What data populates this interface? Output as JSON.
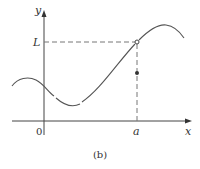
{
  "figure": {
    "caption": "(b)",
    "axes": {
      "x_label": "x",
      "y_label": "y",
      "origin_label": "0"
    },
    "markers": {
      "x_marker_label": "a",
      "y_marker_label": "L"
    },
    "points": {
      "open_circle": "limit point (a, L)",
      "filled_dot": "function value f(a)"
    },
    "colors": {
      "axis": "#333333",
      "curve": "#555555",
      "dashed": "#777777"
    }
  }
}
